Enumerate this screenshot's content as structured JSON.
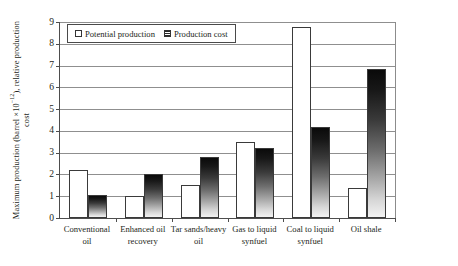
{
  "chart_data": {
    "type": "bar",
    "title": "",
    "subtitle": "",
    "xlabel": "",
    "ylabel": "Maximum production (barrel ×10⁻¹², relative production cost)",
    "ylabel_parts": {
      "before": "Maximum production (barrel ×10",
      "exponent": "−12",
      "after": "), relative production cost"
    },
    "ylim": [
      0,
      9
    ],
    "ytick_values": [
      0,
      1,
      2,
      3,
      4,
      5,
      6,
      7,
      8,
      9
    ],
    "ytick_labels": [
      "0",
      "1",
      "2",
      "3",
      "4",
      "5",
      "6",
      "7",
      "8",
      "9"
    ],
    "grid": true,
    "grid_axis": "y",
    "legend_position": "top-left-inside",
    "categories": [
      "Conventional oil",
      "Enhanced oil recovery",
      "Tar sands/heavy oil",
      "Gas to liquid synfuel",
      "Coal to liquid synfuel",
      "Oil shale"
    ],
    "category_label_lines": [
      [
        "Conventional",
        "oil"
      ],
      [
        "Enhanced oil",
        "recovery"
      ],
      [
        "Tar sands/heavy",
        "oil"
      ],
      [
        "Gas to liquid",
        "synfuel"
      ],
      [
        "Coal to liquid",
        "synfuel"
      ],
      [
        "Oil shale"
      ]
    ],
    "series": [
      {
        "name": "Potential production",
        "style": "open-white",
        "values": [
          2.2,
          1.0,
          1.5,
          3.5,
          8.75,
          1.4
        ]
      },
      {
        "name": "Production cost",
        "style": "gradient-dark",
        "values": [
          1.05,
          2.0,
          2.8,
          3.2,
          4.2,
          6.85
        ]
      }
    ]
  },
  "legend": {
    "items": [
      {
        "label": "Potential production",
        "swatch": "open-square"
      },
      {
        "label": "Production cost",
        "swatch": "hatched-square"
      }
    ]
  },
  "colors": {
    "axis": "#4d4d4d",
    "gridline": "#8f8f8f",
    "bar_outline": "#3a3a3a",
    "potential_fill": "#ffffff",
    "cost_fill_top": "#0a0a0a",
    "cost_fill_bottom": "#f2f2f2",
    "text": "#231f20",
    "background": "#ffffff"
  }
}
